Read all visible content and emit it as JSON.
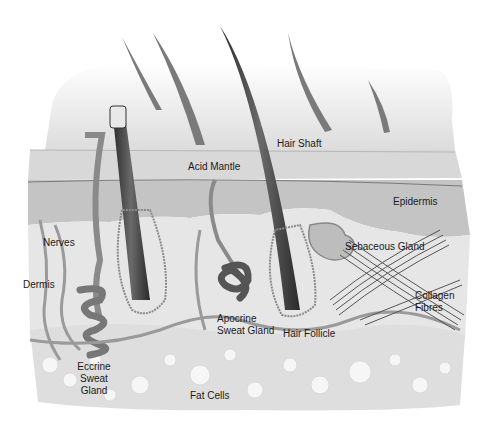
{
  "diagram": {
    "type": "anatomical illustration",
    "labels": {
      "hair_shaft": "Hair Shaft",
      "acid_mantle": "Acid Mantle",
      "epidermis": "Epidermis",
      "nerves": "Nerves",
      "sebaceous_gland": "Sebaceous Gland",
      "dermis": "Dermis",
      "collagen_line1": "Collagen",
      "collagen_line2": "Fibres",
      "apocrine_line1": "Apocrine",
      "apocrine_line2": "Sweat Gland",
      "hair_follicle": "Hair Follicle",
      "eccrine_line1": "Eccrine",
      "eccrine_line2": "Sweat",
      "eccrine_line3": "Gland",
      "fat_cells": "Fat Cells"
    }
  }
}
